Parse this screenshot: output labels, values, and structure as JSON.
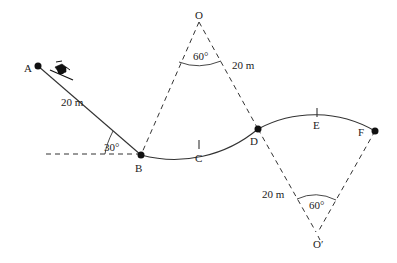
{
  "diagram": {
    "type": "ski-track-physics-diagram",
    "points": {
      "A": "A",
      "B": "B",
      "C": "C",
      "D": "D",
      "E": "E",
      "F": "F",
      "O": "O",
      "O_prime": "O′"
    },
    "labels": {
      "incline_length": "20 m",
      "incline_angle": "30°",
      "upper_radius": "20 m",
      "upper_angle": "60°",
      "lower_radius": "20 m",
      "lower_angle": "60°"
    },
    "segments": [
      {
        "from": "A",
        "to": "B",
        "kind": "straight incline",
        "length": "20 m",
        "angle": "30°"
      },
      {
        "from": "B",
        "to": "D",
        "kind": "circular arc (valley)",
        "center": "O",
        "radius": "20 m",
        "central_angle": "60°",
        "midpoint": "C"
      },
      {
        "from": "D",
        "to": "F",
        "kind": "circular arc (hill)",
        "center": "O′",
        "radius": "20 m",
        "central_angle": "60°",
        "midpoint": "E"
      }
    ],
    "colors": {
      "line": "#333333",
      "text": "#222222",
      "background": "#ffffff"
    }
  }
}
